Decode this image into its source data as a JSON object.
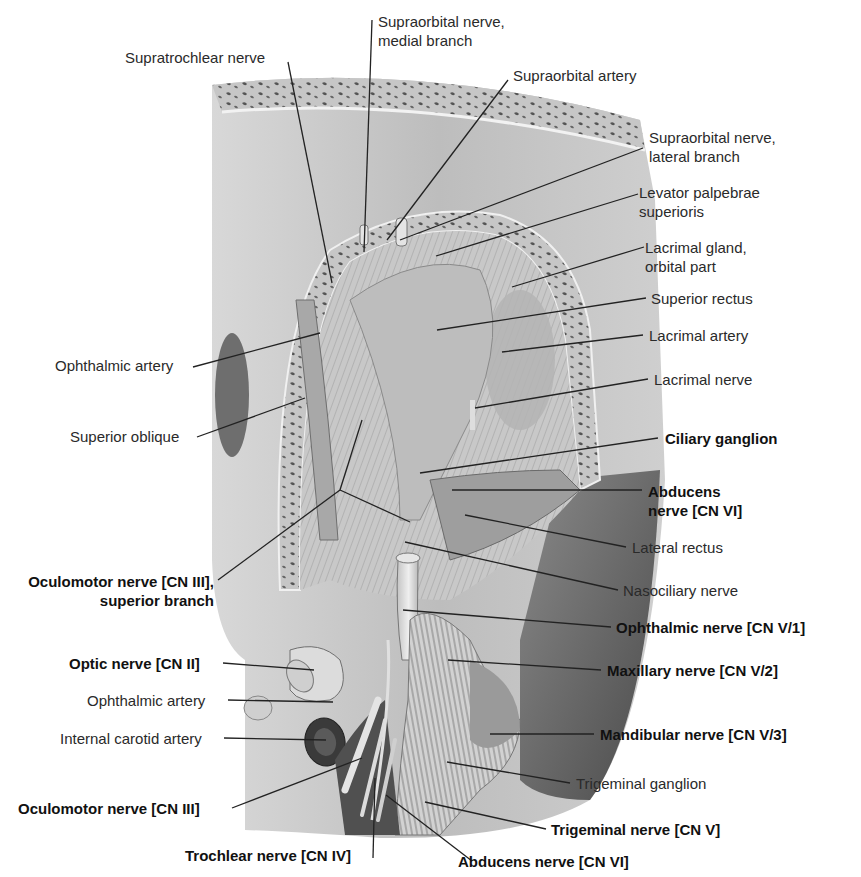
{
  "figure": {
    "colors": {
      "background": "#ffffff",
      "bone_light": "#c9c9c9",
      "bone_dark": "#5a5a5a",
      "tissue_mid": "#9a9a9a",
      "tissue_dark": "#3c3c3c",
      "nerve_light": "#dedede",
      "leader_line": "#222222",
      "label_text": "#2a2a2a"
    }
  },
  "labels": {
    "supratrochlear_nerve": {
      "text": "Supratrochlear nerve",
      "bold": false
    },
    "supraorbital_nerve_medial": {
      "line1": "Supraorbital nerve,",
      "line2": "medial branch",
      "bold": false
    },
    "supraorbital_artery": {
      "text": "Supraorbital artery",
      "bold": false
    },
    "supraorbital_nerve_lateral": {
      "line1": "Supraorbital nerve,",
      "line2": "lateral branch",
      "bold": false
    },
    "levator_palpebrae": {
      "line1": "Levator palpebrae",
      "line2": "superioris",
      "bold": false
    },
    "lacrimal_gland": {
      "line1": "Lacrimal gland,",
      "line2": "orbital part",
      "bold": false
    },
    "superior_rectus": {
      "text": "Superior rectus",
      "bold": false
    },
    "lacrimal_artery": {
      "text": "Lacrimal artery",
      "bold": false
    },
    "lacrimal_nerve": {
      "text": "Lacrimal nerve",
      "bold": false
    },
    "ciliary_ganglion": {
      "text": "Ciliary ganglion",
      "bold": true
    },
    "abducens_nerve_upper": {
      "line1": "Abducens",
      "line2": "nerve [CN VI]",
      "bold": true
    },
    "lateral_rectus": {
      "text": "Lateral rectus",
      "bold": false
    },
    "nasociliary_nerve": {
      "text": "Nasociliary nerve",
      "bold": false
    },
    "ophthalmic_nerve": {
      "text": "Ophthalmic nerve [CN V/1]",
      "bold": true
    },
    "maxillary_nerve": {
      "text": "Maxillary nerve [CN V/2]",
      "bold": true
    },
    "mandibular_nerve": {
      "text": "Mandibular nerve [CN V/3]",
      "bold": true
    },
    "trigeminal_ganglion": {
      "text": "Trigeminal ganglion",
      "bold": false
    },
    "trigeminal_nerve": {
      "text": "Trigeminal nerve [CN V]",
      "bold": true
    },
    "abducens_nerve_lower": {
      "text": "Abducens nerve [CN VI]",
      "bold": true
    },
    "trochlear_nerve": {
      "text": "Trochlear nerve [CN IV]",
      "bold": true
    },
    "oculomotor_nerve": {
      "text": "Oculomotor nerve [CN III]",
      "bold": true
    },
    "internal_carotid_artery": {
      "text": "Internal carotid artery",
      "bold": false
    },
    "ophthalmic_artery_lower": {
      "text": "Ophthalmic artery",
      "bold": false
    },
    "optic_nerve": {
      "text": "Optic nerve [CN II]",
      "bold": true
    },
    "oculomotor_superior_branch": {
      "line1": "Oculomotor nerve [CN III],",
      "line2": "superior branch",
      "bold": true
    },
    "superior_oblique": {
      "text": "Superior oblique",
      "bold": false
    },
    "ophthalmic_artery_upper": {
      "text": "Ophthalmic artery",
      "bold": false
    }
  }
}
